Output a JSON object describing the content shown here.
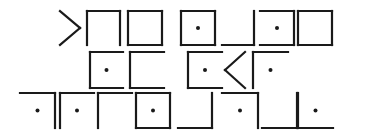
{
  "ink_color": "#1a1a1a",
  "background_color": "#ffffff",
  "rows": [
    [
      {
        "shape": "chevron-right",
        "dot": false
      },
      {
        "shape": "open-bottom",
        "dot": false
      },
      {
        "shape": "box",
        "dot": false
      },
      {
        "shape": "box",
        "dot": true
      },
      {
        "shape": "bottom-right",
        "dot": false
      },
      {
        "shape": "open-left",
        "dot": true
      },
      {
        "shape": "box",
        "dot": false
      }
    ],
    [
      {
        "shape": "open-right",
        "dot": true
      },
      {
        "shape": "open-right",
        "dot": false
      },
      {
        "shape": "open-right",
        "dot": true
      },
      {
        "shape": "chevron-left",
        "dot": false
      },
      {
        "shape": "top-left",
        "dot": true
      }
    ],
    [
      {
        "shape": "top-right",
        "dot": true
      },
      {
        "shape": "top-left",
        "dot": true
      },
      {
        "shape": "top-left",
        "dot": false
      },
      {
        "shape": "box",
        "dot": true
      },
      {
        "shape": "bottom-right",
        "dot": false
      },
      {
        "shape": "top-right",
        "dot": true
      },
      {
        "shape": "bottom-right",
        "dot": false
      },
      {
        "shape": "bottom-left",
        "dot": true
      }
    ]
  ]
}
